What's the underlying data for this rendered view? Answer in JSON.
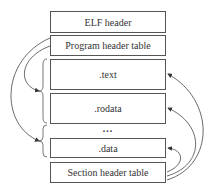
{
  "diagram": {
    "type": "ELF file layout",
    "sections": [
      {
        "id": "elf-header",
        "label": "ELF header"
      },
      {
        "id": "program-header-table",
        "label": "Program header table"
      },
      {
        "id": "text",
        "label": ".text"
      },
      {
        "id": "rodata",
        "label": ".rodata"
      },
      {
        "id": "ellipsis",
        "label": "..."
      },
      {
        "id": "data",
        "label": ".data"
      },
      {
        "id": "section-header-table",
        "label": "Section header table"
      }
    ],
    "arrows": [
      {
        "from": "Program header table",
        "to": "segment (.text + .rodata)"
      },
      {
        "from": "Program header table",
        "to": "segment (.data)"
      },
      {
        "from": "Section header table",
        "to": ".text"
      },
      {
        "from": "Section header table",
        "to": ".rodata"
      },
      {
        "from": "Section header table",
        "to": ".data"
      }
    ],
    "colors": {
      "line": "#555555",
      "background": "#ffffff"
    }
  }
}
